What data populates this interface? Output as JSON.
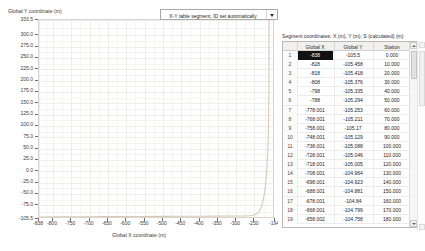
{
  "combo": {
    "label": "X-Y table segment, ID set automatically",
    "arrow_icon": "chevron-down-icon"
  },
  "plot": {
    "y_axis_title": "Global Y coordinate (m)",
    "x_axis_title": "Global X coordinate (m)"
  },
  "table": {
    "caption": "Segment coordinates: X (m), Y (m), S (calculated) (m)",
    "headers": [
      "",
      "Global X",
      "Global Y",
      "Station"
    ],
    "selected_cell": {
      "row": 1,
      "column": "Global X"
    },
    "rows": [
      {
        "idx": "1",
        "gx": "-838",
        "gy": "-105.5",
        "st": "0.000"
      },
      {
        "idx": "2",
        "gx": "-828",
        "gy": "-105.458",
        "st": "10.000"
      },
      {
        "idx": "3",
        "gx": "-818",
        "gy": "-105.418",
        "st": "20.000"
      },
      {
        "idx": "4",
        "gx": "-808",
        "gy": "-105.376",
        "st": "30.000"
      },
      {
        "idx": "5",
        "gx": "-798",
        "gy": "-105.335",
        "st": "40.000"
      },
      {
        "idx": "6",
        "gx": "-788",
        "gy": "-105.294",
        "st": "50.000"
      },
      {
        "idx": "7",
        "gx": "-778.001",
        "gy": "-105.253",
        "st": "60.000"
      },
      {
        "idx": "8",
        "gx": "-768.001",
        "gy": "-105.211",
        "st": "70.000"
      },
      {
        "idx": "9",
        "gx": "-758.001",
        "gy": "-105.17",
        "st": "80.000"
      },
      {
        "idx": "10",
        "gx": "-748.001",
        "gy": "-105.129",
        "st": "90.000"
      },
      {
        "idx": "11",
        "gx": "-738.001",
        "gy": "-105.088",
        "st": "100.000"
      },
      {
        "idx": "12",
        "gx": "-728.001",
        "gy": "-105.046",
        "st": "110.000"
      },
      {
        "idx": "13",
        "gx": "-718.001",
        "gy": "-105.005",
        "st": "120.000"
      },
      {
        "idx": "14",
        "gx": "-708.001",
        "gy": "-104.964",
        "st": "130.000"
      },
      {
        "idx": "15",
        "gx": "-698.001",
        "gy": "-104.923",
        "st": "140.000"
      },
      {
        "idx": "16",
        "gx": "-688.001",
        "gy": "-104.881",
        "st": "150.000"
      },
      {
        "idx": "17",
        "gx": "-678.001",
        "gy": "-104.84",
        "st": "160.000"
      },
      {
        "idx": "18",
        "gx": "-668.001",
        "gy": "-104.799",
        "st": "170.000"
      },
      {
        "idx": "19",
        "gx": "-658.002",
        "gy": "-104.758",
        "st": "180.000"
      }
    ]
  },
  "chart_data": {
    "type": "line",
    "title": "",
    "xlabel": "Global X coordinate (m)",
    "ylabel": "Global Y coordinate (m)",
    "xlim": [
      -838,
      -194
    ],
    "ylim": [
      -105.5,
      333.5
    ],
    "grid": true,
    "legend": false,
    "x_ticks": [
      -838,
      -800,
      -750,
      -700,
      -650,
      -600,
      -550,
      -500,
      -450,
      -400,
      -350,
      -300,
      -250,
      -194
    ],
    "x_tick_labels": [
      "-838",
      "-800",
      "-750",
      "-700",
      "-650",
      "-600",
      "-550",
      "-500",
      "-450",
      "-400",
      "-350",
      "-300",
      "-250",
      "-194"
    ],
    "y_ticks": [
      333.5,
      300.0,
      275.0,
      250.0,
      225.0,
      200.0,
      175.0,
      150.0,
      125.0,
      100.0,
      75.0,
      50.0,
      25.0,
      0.0,
      -25.0,
      -50.0,
      -75.0,
      -105.5
    ],
    "y_tick_labels": [
      "333.5",
      "300.0",
      "275.0",
      "250.0",
      "225.0",
      "200.0",
      "175.0",
      "150.0",
      "125.0",
      "100.0",
      "75.0",
      "50.0",
      "25.0",
      "0.0",
      "-25.0",
      "-50.0",
      "-75.0",
      "-105.5"
    ],
    "series": [
      {
        "name": "segment alignment",
        "color": "#d9c9b4",
        "x": [
          -838,
          -800,
          -750,
          -700,
          -650,
          -600,
          -550,
          -500,
          -450,
          -400,
          -350,
          -300,
          -270,
          -250,
          -240,
          -232,
          -226,
          -222,
          -218,
          -215,
          -212,
          -210,
          -208,
          -207,
          -206,
          -205.5,
          -205,
          -205,
          -205,
          -205,
          -205,
          -205
        ],
        "y": [
          -105.5,
          -105.3,
          -105.1,
          -104.9,
          -104.7,
          -104.5,
          -104.3,
          -104.1,
          -103.9,
          -103.7,
          -103.5,
          -103.2,
          -103.0,
          -102.0,
          -99.0,
          -93.0,
          -83.0,
          -72.0,
          -55.0,
          -36.0,
          -12.0,
          14.0,
          46.0,
          78.0,
          120.0,
          170.0,
          215.0,
          250.0,
          280.0,
          305.0,
          322.0,
          333.5
        ]
      }
    ]
  }
}
